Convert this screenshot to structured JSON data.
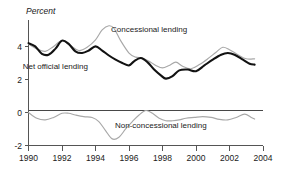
{
  "chart_data": {
    "type": "line",
    "title": "",
    "ylabel": "Percent",
    "xlabel": "",
    "xlim": [
      1990,
      2004
    ],
    "ylim": [
      -2,
      5.6
    ],
    "grid": false,
    "legend_position": "inline-annotations",
    "y_ticks": [
      "-2",
      "0",
      "2",
      "4"
    ],
    "y_tick_values": [
      -2,
      0,
      2,
      4
    ],
    "x_ticks": [
      "1990",
      "1992",
      "1994",
      "1996",
      "1998",
      "2000",
      "2002",
      "2004"
    ],
    "x_tick_values": [
      1990,
      1992,
      1994,
      1996,
      1998,
      2000,
      2002,
      2004
    ],
    "annotations": [
      {
        "name": "concessional-lending-label",
        "text": "Concessional lending",
        "x": 1997.2,
        "y": 4.85
      },
      {
        "name": "net-official-lending-label",
        "text": "Net official lending",
        "x": 1991.6,
        "y": 2.65
      },
      {
        "name": "non-concessional-lending-label",
        "text": "Non-concessional lending",
        "x": 1997.9,
        "y": -0.95
      }
    ],
    "series": [
      {
        "name": "Net official lending",
        "color": "#121212",
        "style": "solid-thick",
        "x": [
          1990.0,
          1990.4,
          1990.8,
          1991.2,
          1991.6,
          1992.0,
          1992.4,
          1992.8,
          1993.2,
          1993.6,
          1994.0,
          1994.4,
          1994.8,
          1995.2,
          1995.6,
          1996.0,
          1996.3,
          1996.7,
          1997.1,
          1997.5,
          1997.9,
          1998.2,
          1998.6,
          1999.0,
          1999.5,
          2000.0,
          2000.5,
          2001.0,
          2001.5,
          2001.9,
          2002.3,
          2002.8,
          2003.2,
          2003.5
        ],
        "values": [
          4.2,
          4.0,
          3.55,
          3.5,
          3.85,
          4.35,
          4.15,
          3.7,
          3.6,
          3.75,
          4.0,
          3.75,
          3.45,
          3.2,
          3.0,
          2.85,
          3.1,
          3.3,
          3.05,
          2.6,
          2.25,
          2.05,
          2.2,
          2.55,
          2.6,
          2.5,
          2.85,
          3.2,
          3.5,
          3.6,
          3.5,
          3.2,
          2.95,
          2.9
        ]
      },
      {
        "name": "Concessional lending",
        "color": "#a8a8a8",
        "style": "solid-thin",
        "x": [
          1990.0,
          1990.5,
          1991.0,
          1991.5,
          1992.0,
          1992.5,
          1993.0,
          1993.5,
          1994.0,
          1994.4,
          1994.8,
          1995.1,
          1995.5,
          1996.0,
          1996.4,
          1996.8,
          1997.2,
          1997.6,
          1998.0,
          1998.4,
          1998.8,
          1999.2,
          1999.7,
          2000.2,
          2000.7,
          2001.2,
          2001.6,
          2002.0,
          2002.5,
          2003.0,
          2003.5
        ],
        "values": [
          4.15,
          3.85,
          3.7,
          4.0,
          4.35,
          4.05,
          3.75,
          3.95,
          4.4,
          5.0,
          5.25,
          5.1,
          4.35,
          3.6,
          3.35,
          3.3,
          3.1,
          2.85,
          2.7,
          2.85,
          3.05,
          2.8,
          2.65,
          2.9,
          3.25,
          3.65,
          3.95,
          3.8,
          3.5,
          3.25,
          3.25
        ]
      },
      {
        "name": "Non-concessional lending",
        "color": "#a8a8a8",
        "style": "solid-thin",
        "x": [
          1990.0,
          1990.5,
          1991.0,
          1991.5,
          1992.0,
          1992.4,
          1992.8,
          1993.3,
          1993.8,
          1994.2,
          1994.6,
          1995.0,
          1995.4,
          1995.8,
          1996.2,
          1996.6,
          1997.0,
          1997.4,
          1997.8,
          1998.2,
          1998.6,
          1999.0,
          1999.4,
          1999.9,
          2000.4,
          2000.9,
          2001.4,
          2001.9,
          2002.4,
          2002.9,
          2003.3,
          2003.5
        ],
        "values": [
          0.0,
          -0.35,
          -0.45,
          -0.3,
          -0.05,
          -0.05,
          -0.15,
          -0.25,
          -0.3,
          -0.55,
          -1.1,
          -1.6,
          -1.5,
          -1.0,
          -0.55,
          -0.15,
          0.12,
          -0.05,
          -0.35,
          -0.5,
          -0.5,
          -0.45,
          -0.35,
          -0.3,
          -0.25,
          -0.3,
          -0.42,
          -0.45,
          -0.3,
          -0.1,
          -0.3,
          -0.4
        ]
      }
    ]
  },
  "axis": {
    "y_title": "Percent"
  }
}
